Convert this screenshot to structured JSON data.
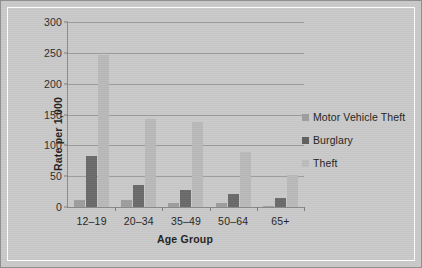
{
  "chart_data": {
    "type": "bar",
    "title": "",
    "xlabel": "Age Group",
    "ylabel": "Rate per 1,000",
    "categories": [
      "12–19",
      "20–34",
      "35–49",
      "50–64",
      "65+"
    ],
    "series": [
      {
        "name": "Motor Vehicle Theft",
        "color": "#9d9d9d",
        "values": [
          12,
          12,
          6,
          7,
          2
        ]
      },
      {
        "name": "Burglary",
        "color": "#6a6a6a",
        "values": [
          83,
          36,
          28,
          21,
          15
        ]
      },
      {
        "name": "Theft",
        "color": "#b9b9b9",
        "values": [
          247,
          143,
          138,
          89,
          52
        ]
      }
    ],
    "ylim": [
      0,
      300
    ],
    "yticks": [
      0,
      50,
      100,
      150,
      200,
      250,
      300
    ],
    "ytick_labels": [
      "0",
      "50",
      "100",
      "150",
      "200",
      "250",
      "300"
    ],
    "grid": true,
    "legend_position": "right"
  },
  "figure": {
    "background_color": "#c9c9c9",
    "border_color": "#8f8f8f",
    "gridline_color": "#9b9b9b",
    "axis_color": "#8a8a8a"
  }
}
